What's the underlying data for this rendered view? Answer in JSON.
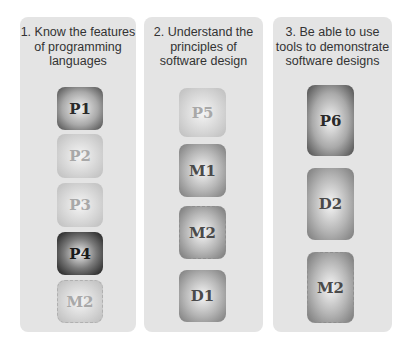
{
  "columns": [
    {
      "title": "1. Know the features of programming languages",
      "title_lines": [
        "1. Know the features",
        "of programming",
        "languages"
      ],
      "boxes": [
        {
          "label": "P1",
          "style": "dark"
        },
        {
          "label": "P2",
          "style": "light"
        },
        {
          "label": "P3",
          "style": "light"
        },
        {
          "label": "P4",
          "style": "darker"
        },
        {
          "label": "M2",
          "style": "light-dashed"
        }
      ]
    },
    {
      "title": "2. Understand the principles of software design",
      "title_lines": [
        "2. Understand the",
        "principles of",
        "software design"
      ],
      "boxes": [
        {
          "label": "P5",
          "style": "light"
        },
        {
          "label": "M1",
          "style": "mid"
        },
        {
          "label": "M2",
          "style": "mid-dashed"
        },
        {
          "label": "D1",
          "style": "mid"
        }
      ]
    },
    {
      "title": "3. Be able to use tools to demonstrate software designs",
      "title_lines": [
        "3. Be able to use",
        "tools to demonstrate",
        "software designs"
      ],
      "boxes": [
        {
          "label": "P6",
          "style": "dark"
        },
        {
          "label": "D2",
          "style": "mid"
        },
        {
          "label": "M2",
          "style": "mid-dashed"
        }
      ]
    }
  ]
}
